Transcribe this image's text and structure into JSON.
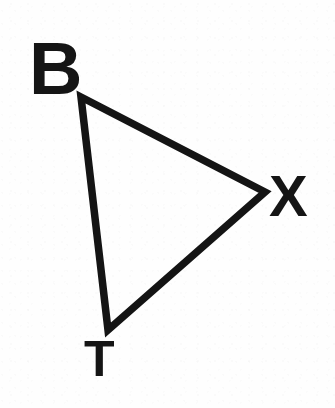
{
  "figure": {
    "kind": "geometry-diagram",
    "name": "Triangle BXT",
    "background_color": "#fefefe",
    "ink_color": "#151515",
    "canvas": {
      "width": 335,
      "height": 408
    }
  },
  "shape": {
    "type": "triangle",
    "stroke_color": "#141414",
    "stroke_width": 7.5,
    "fill": "none",
    "linejoin": "miter",
    "vertices": [
      {
        "id": "B",
        "x": 81,
        "y": 97
      },
      {
        "id": "X",
        "x": 265,
        "y": 192
      },
      {
        "id": "T",
        "x": 108,
        "y": 330
      }
    ],
    "edges": [
      {
        "from": "B",
        "to": "X"
      },
      {
        "from": "X",
        "to": "T"
      },
      {
        "from": "T",
        "to": "B"
      }
    ],
    "path": "M 81 97 L 265 192 L 108 330 Z"
  },
  "labels": {
    "vertex_b": "B",
    "vertex_x": "X",
    "vertex_t": "T"
  }
}
